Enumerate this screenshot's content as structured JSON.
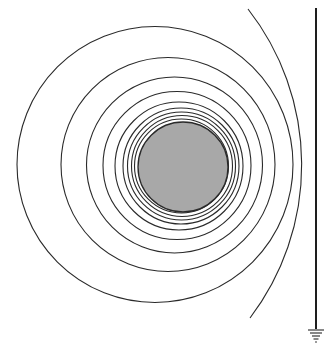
{
  "diagram": {
    "colors": {
      "sphere_fill": "#a8a8a8",
      "sphere_stroke": "#2a2a2a",
      "line": "#2a2a2a",
      "background": "#ffffff"
    },
    "sphere": {
      "cx": 183,
      "cy": 167,
      "r": 45
    },
    "equipotentials": [
      {
        "cx": 181.5,
        "cy": 166,
        "r": 47
      },
      {
        "cx": 182,
        "cy": 166,
        "r": 50.5
      },
      {
        "cx": 181.5,
        "cy": 166,
        "r": 54
      },
      {
        "cx": 181,
        "cy": 166,
        "r": 58
      },
      {
        "cx": 179,
        "cy": 166,
        "r": 64
      },
      {
        "cx": 177,
        "cy": 165.5,
        "r": 74
      },
      {
        "cx": 174.5,
        "cy": 165,
        "r": 88
      },
      {
        "cx": 168,
        "cy": 164.5,
        "r": 107
      },
      {
        "cx": 155,
        "cy": 164.5,
        "r": 138
      }
    ],
    "open_arc": {
      "start": [
        248,
        9
      ],
      "end": [
        250,
        318
      ],
      "r": 253
    },
    "plane": {
      "x": 316,
      "y1": 8,
      "y2": 329
    },
    "ground_symbol": {
      "x": 316,
      "bars": [
        {
          "y": 330,
          "half_width": 8
        },
        {
          "y": 333,
          "half_width": 6
        },
        {
          "y": 336,
          "half_width": 4
        },
        {
          "y": 339,
          "half_width": 2.5
        },
        {
          "y": 342,
          "half_width": 1
        }
      ]
    }
  }
}
